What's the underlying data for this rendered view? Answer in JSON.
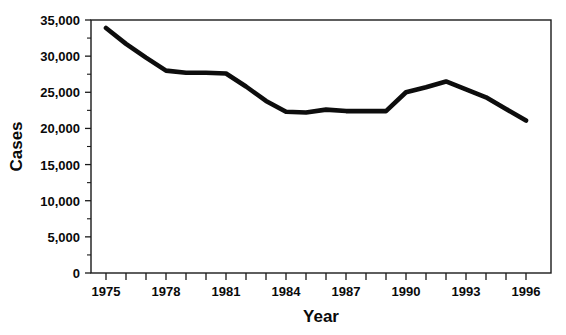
{
  "chart_data": {
    "type": "line",
    "title": "",
    "xlabel": "Year",
    "ylabel": "Cases",
    "x": [
      1975,
      1976,
      1977,
      1978,
      1979,
      1980,
      1981,
      1982,
      1983,
      1984,
      1985,
      1986,
      1987,
      1988,
      1989,
      1990,
      1991,
      1992,
      1993,
      1994,
      1995,
      1996
    ],
    "values": [
      33900,
      31700,
      29800,
      28000,
      27700,
      27700,
      27600,
      25800,
      23800,
      22300,
      22200,
      22600,
      22400,
      22400,
      22400,
      25000,
      25700,
      26500,
      25400,
      24300,
      22700,
      21100
    ],
    "series": [
      {
        "name": "Cases",
        "values": [
          33900,
          31700,
          29800,
          28000,
          27700,
          27700,
          27600,
          25800,
          23800,
          22300,
          22200,
          22600,
          22400,
          22400,
          22400,
          25000,
          25700,
          26500,
          25400,
          24300,
          22700,
          21100
        ]
      }
    ],
    "xlim": [
      1974.25,
      1997.25
    ],
    "ylim": [
      0,
      35000
    ],
    "ytick_values": [
      0,
      5000,
      10000,
      15000,
      20000,
      25000,
      30000,
      35000
    ],
    "ytick_labels": [
      "0",
      "5,000",
      "10,000",
      "15,000",
      "20,000",
      "25,000",
      "30,000",
      "35,000"
    ],
    "yminor_step": 2500,
    "xtick_values": [
      1975,
      1976,
      1977,
      1978,
      1979,
      1980,
      1981,
      1982,
      1983,
      1984,
      1985,
      1986,
      1987,
      1988,
      1989,
      1990,
      1991,
      1992,
      1993,
      1994,
      1995,
      1996
    ],
    "xtick_labeled": [
      {
        "value": 1975,
        "label": "1975"
      },
      {
        "value": 1978,
        "label": "1978"
      },
      {
        "value": 1981,
        "label": "1981"
      },
      {
        "value": 1984,
        "label": "1984"
      },
      {
        "value": 1987,
        "label": "1987"
      },
      {
        "value": 1990,
        "label": "1990"
      },
      {
        "value": 1993,
        "label": "1993"
      },
      {
        "value": 1996,
        "label": "1996"
      }
    ],
    "grid": false,
    "legend": false,
    "legend_position": "none",
    "line_color": "#0d0d0d",
    "axis_color": "#1a1a1a",
    "background_color": "#ffffff",
    "frame": "box"
  }
}
